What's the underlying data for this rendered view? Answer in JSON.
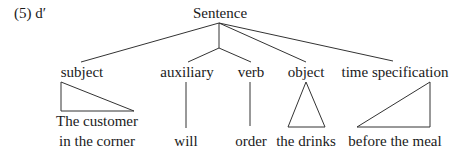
{
  "example_label": "(5)  d′",
  "root": "Sentence",
  "constituents": [
    {
      "label": "subject",
      "leaf_lines": [
        "The customer",
        "in the corner"
      ],
      "shape": "right-triangle-left"
    },
    {
      "label": "auxiliary",
      "leaf_lines": [
        "will"
      ],
      "shape": "line"
    },
    {
      "label": "verb",
      "leaf_lines": [
        "order"
      ],
      "shape": "line"
    },
    {
      "label": "object",
      "leaf_lines": [
        "the drinks"
      ],
      "shape": "triangle"
    },
    {
      "label": "time specification",
      "leaf_lines": [
        "before the meal"
      ],
      "shape": "right-triangle-right"
    }
  ],
  "colors": {
    "ink": "#1a1a1a",
    "line": "#333333",
    "background": "#ffffff"
  }
}
